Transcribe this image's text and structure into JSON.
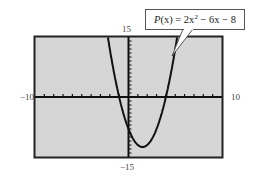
{
  "chart_data": {
    "type": "line",
    "title": "",
    "function": {
      "label": "P(x) = 2x² − 6x − 8",
      "a": 2,
      "b": -6,
      "c": -8
    },
    "series": [
      {
        "name": "P(x) = 2x^2 - 6x - 8",
        "x": [
          -2.5,
          -2,
          -1.5,
          -1,
          -0.5,
          0,
          0.5,
          1,
          1.5,
          2,
          2.5,
          3,
          3.5,
          4,
          4.5,
          5,
          5.5
        ],
        "values": [
          19.5,
          12,
          5.5,
          0,
          -4.5,
          -8,
          -10.5,
          -12,
          -12.5,
          -12,
          -10.5,
          -8,
          -4.5,
          0,
          5.5,
          12,
          19.5
        ]
      }
    ],
    "xlim": [
      -10,
      10
    ],
    "ylim": [
      -15,
      15
    ],
    "x_tick_step": 1,
    "y_tick_step": 1,
    "xlabel": "",
    "ylabel": "",
    "tick_labels": {
      "xmin": "−10",
      "xmax": "10",
      "ymin": "−15",
      "ymax": "15"
    },
    "grid": false,
    "legend": "callout",
    "background": "#d6d6d6",
    "frame_color": "#222222",
    "curve_color": "#111111"
  },
  "labels": {
    "xmin": "−10",
    "xmax": "10",
    "ymax": "15",
    "ymin": "−15"
  },
  "callout": {
    "name": "P",
    "arg": "(x)",
    "eq": " = 2x",
    "exp": "2",
    "rest": " − 6x − 8"
  }
}
